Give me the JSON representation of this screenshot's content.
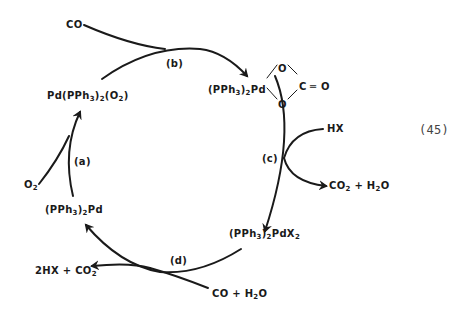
{
  "diagram": {
    "type": "catalytic-cycle",
    "equation_number": "(45)",
    "species": {
      "co_in": "CO",
      "pd_o2": {
        "a": "Pd(PPh",
        "b": "3",
        "c": ")",
        "d": "2",
        "e": "(O",
        "f": "2",
        "g": ")"
      },
      "pd_carbonate": {
        "a": "(PPh",
        "b": "3",
        "c": ")",
        "d": "2",
        "e": "Pd"
      },
      "ring_o_top": "O",
      "ring_o_bottom": "O",
      "ring_c": "C",
      "ring_eq": "═",
      "ring_o_exo": "O",
      "hx": "HX",
      "co2_h2o": {
        "a": "CO",
        "b": "2",
        "c": " + H",
        "d": "2",
        "e": "O"
      },
      "pdx2": {
        "a": "(PPh",
        "b": "3",
        "c": ")",
        "d": "2",
        "e": "PdX",
        "f": "2"
      },
      "co_h2o": {
        "a": "CO + H",
        "b": "2",
        "c": "O"
      },
      "hx_co2": {
        "a": "2HX + CO",
        "b": "2"
      },
      "pd0": {
        "a": "(PPh",
        "b": "3",
        "c": ")",
        "d": "2",
        "e": "Pd"
      },
      "o2": {
        "a": "O",
        "b": "2"
      }
    },
    "steps": {
      "a": "(a)",
      "b": "(b)",
      "c": "(c)",
      "d": "(d)"
    },
    "colors": {
      "ink": "#1a1a1a",
      "background": "#ffffff"
    }
  }
}
